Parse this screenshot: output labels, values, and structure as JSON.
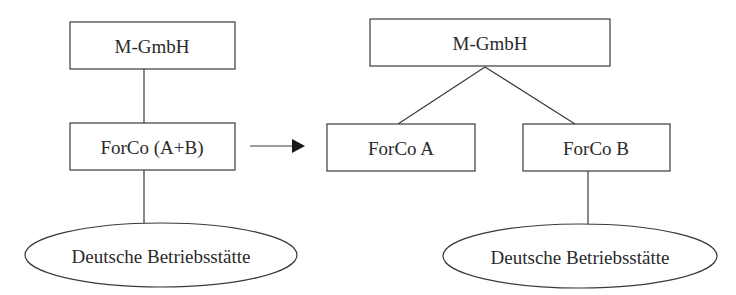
{
  "diagram": {
    "type": "restructuring-diagram",
    "before": {
      "parent": "M-GmbH",
      "subsidiary": "ForCo (A+B)",
      "permanent_establishment": "Deutsche Betriebsstätte"
    },
    "transition": "arrow-right",
    "after": {
      "parent": "M-GmbH",
      "subsidiaries": [
        "ForCo A",
        "ForCo B"
      ],
      "permanent_establishment": "Deutsche Betriebsstätte",
      "permanent_establishment_owner": "ForCo B"
    },
    "colors": {
      "line": "#3a3a3a",
      "text": "#2a2a2a",
      "background": "#ffffff"
    }
  }
}
